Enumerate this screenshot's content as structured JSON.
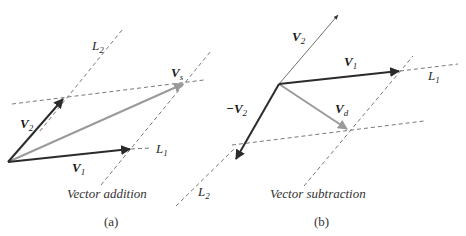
{
  "colors": {
    "dark_vector": "#2b2b2b",
    "gray_vector": "#9a9a9a",
    "dashed_line": "#555555",
    "text": "#2a2a2a",
    "background": "#ffffff"
  },
  "panel_a": {
    "caption": "Vector addition",
    "label": "(a)",
    "vectors": {
      "v1": {
        "name": "V",
        "sub": "1"
      },
      "v2": {
        "name": "V",
        "sub": "2"
      },
      "vs": {
        "name": "V",
        "sub": "s"
      }
    },
    "lines": {
      "l1": {
        "name": "L",
        "sub": "1"
      },
      "l2": {
        "name": "L",
        "sub": "2"
      }
    }
  },
  "panel_b": {
    "caption": "Vector subtraction",
    "label": "(b)",
    "vectors": {
      "v1": {
        "name": "V",
        "sub": "1"
      },
      "v2": {
        "name": "V",
        "sub": "2"
      },
      "neg_v2": {
        "name": "−V",
        "sub": "2"
      },
      "vd": {
        "name": "V",
        "sub": "d"
      }
    },
    "lines": {
      "l1": {
        "name": "L",
        "sub": "1"
      },
      "l2": {
        "name": "L",
        "sub": "2"
      }
    }
  }
}
